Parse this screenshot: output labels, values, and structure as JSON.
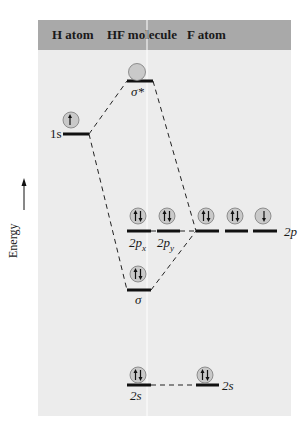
{
  "header": {
    "columns": [
      {
        "label": "H atom"
      },
      {
        "label": "HF molecule"
      },
      {
        "label": "F atom"
      }
    ]
  },
  "axis": {
    "label": "Energy",
    "direction": "up"
  },
  "colors": {
    "header_bg": "#a9a9a9",
    "panel_bg": "#ececec",
    "level": "#111111",
    "orbital_circle": "#c8c8c8"
  },
  "levels": {
    "h_1s": {
      "label": "1s",
      "electrons": "up"
    },
    "sigma_star": {
      "label": "σ*",
      "electrons": "empty"
    },
    "sigma": {
      "label": "σ",
      "electrons": "pair"
    },
    "hf_2px": {
      "label": "2p",
      "sub": "x",
      "electrons": "pair"
    },
    "hf_2py": {
      "label": "2p",
      "sub": "y",
      "electrons": "pair"
    },
    "hf_2s": {
      "label": "2s",
      "electrons": "pair"
    },
    "f_2p": {
      "label": "2p",
      "electrons": [
        "pair",
        "pair",
        "down"
      ]
    },
    "f_2s": {
      "label": "2s",
      "electrons": "pair"
    }
  }
}
